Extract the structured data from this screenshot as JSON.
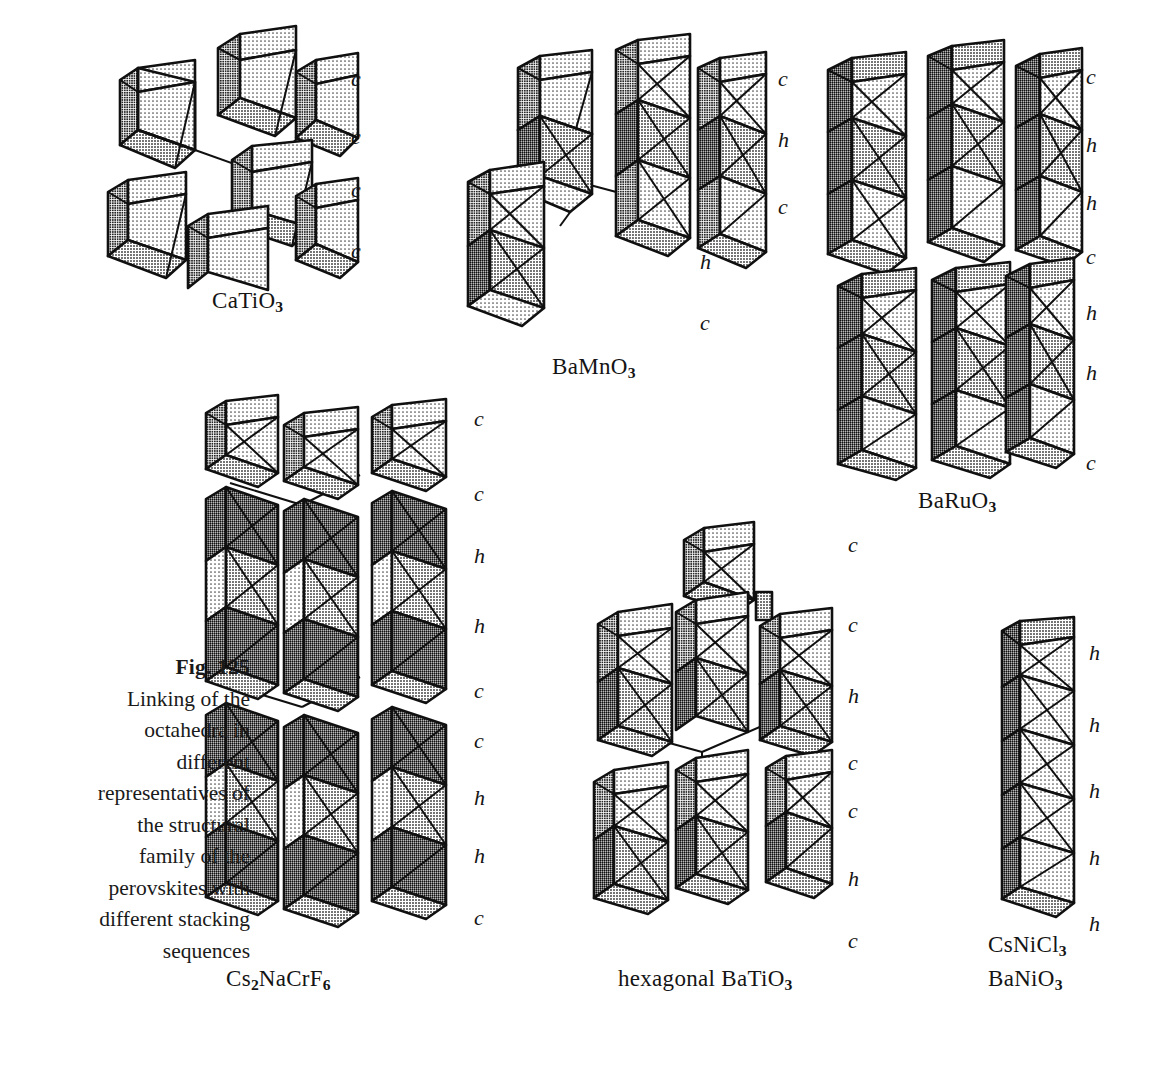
{
  "figure": {
    "number_label": "Fig. 125",
    "caption_lines": [
      "Linking of the",
      "octahedra in",
      "different",
      "representatives of",
      "the structural",
      "family of the",
      "perovskites with",
      "different stacking",
      "sequences"
    ],
    "caption_full": "Fig. 125 Linking of the octahedra in different representatives of the structural family of the perovskites with different stacking sequences"
  },
  "palette": {
    "ink": "#101010",
    "fill_light": "#f2f2f2",
    "fill_mid_light": "#dcdcdc",
    "fill_mid": "#b9b9b9",
    "fill_dark": "#8c8c8c",
    "fill_darker": "#6f6f6f",
    "background": "#ffffff"
  },
  "panels": [
    {
      "id": "catio3",
      "name": "CaTiO3",
      "formula_parts": [
        {
          "t": "CaTiO",
          "sub": false
        },
        {
          "t": "3",
          "sub": true
        }
      ],
      "formula_plain": "CaTiO3",
      "stacking_sequence": [
        "c",
        "c",
        "c",
        "c"
      ],
      "description": "corner-sharing octahedra, cubic perovskite"
    },
    {
      "id": "bamno3",
      "name": "BaMnO3",
      "formula_parts": [
        {
          "t": "BaMnO",
          "sub": false
        },
        {
          "t": "3",
          "sub": true
        }
      ],
      "formula_plain": "BaMnO3",
      "stacking_sequence": [
        "c",
        "h",
        "c",
        "h",
        "c"
      ],
      "description": "mixed corner and face sharing"
    },
    {
      "id": "baruo3",
      "name": "BaRuO3",
      "formula_parts": [
        {
          "t": "BaRuO",
          "sub": false
        },
        {
          "t": "3",
          "sub": true
        }
      ],
      "formula_plain": "BaRuO3",
      "stacking_sequence": [
        "c",
        "h",
        "h",
        "c",
        "h",
        "h",
        "c"
      ],
      "description": "nine-layer stacking"
    },
    {
      "id": "cs2nacrf6",
      "name": "Cs2NaCrF6",
      "formula_parts": [
        {
          "t": "Cs",
          "sub": false
        },
        {
          "t": "2",
          "sub": true
        },
        {
          "t": "NaCrF",
          "sub": false
        },
        {
          "t": "6",
          "sub": true
        }
      ],
      "formula_plain": "Cs2NaCrF6",
      "stacking_sequence": [
        "c",
        "c",
        "h",
        "h",
        "c",
        "c",
        "h",
        "h",
        "c"
      ],
      "description": "elpasolite-type stacking variant"
    },
    {
      "id": "hex-batio3",
      "name": "hexagonal BaTiO3",
      "formula_parts": [
        {
          "t": "hexagonal BaTiO",
          "sub": false
        },
        {
          "t": "3",
          "sub": true
        }
      ],
      "formula_plain": "hexagonal BaTiO3",
      "stacking_sequence": [
        "c",
        "c",
        "h",
        "c",
        "c",
        "h",
        "c"
      ],
      "description": "six-layer hexagonal perovskite"
    },
    {
      "id": "csnicl3",
      "name": "CsNiCl3 / BaNiO3",
      "formula_parts": [
        {
          "t": "CsNiCl",
          "sub": false
        },
        {
          "t": "3",
          "sub": true
        }
      ],
      "formula_parts_2": [
        {
          "t": "BaNiO",
          "sub": false
        },
        {
          "t": "3",
          "sub": true
        }
      ],
      "formula_plain": "CsNiCl3",
      "formula_plain_2": "BaNiO3",
      "stacking_sequence": [
        "h",
        "h",
        "h",
        "h",
        "h"
      ],
      "description": "purely face-sharing chain, 2H stacking"
    }
  ],
  "sequence_labels": {
    "catio3": [
      {
        "char": "c",
        "x": 351,
        "y": 68
      },
      {
        "char": "c",
        "x": 351,
        "y": 126
      },
      {
        "char": "c",
        "x": 351,
        "y": 179
      },
      {
        "char": "c",
        "x": 351,
        "y": 240
      }
    ],
    "bamno3": [
      {
        "char": "c",
        "x": 778,
        "y": 68
      },
      {
        "char": "h",
        "x": 778,
        "y": 129
      },
      {
        "char": "c",
        "x": 778,
        "y": 196
      },
      {
        "char": "h",
        "x": 700,
        "y": 251
      },
      {
        "char": "c",
        "x": 700,
        "y": 312
      }
    ],
    "baruo3": [
      {
        "char": "c",
        "x": 1086,
        "y": 66
      },
      {
        "char": "h",
        "x": 1086,
        "y": 134
      },
      {
        "char": "h",
        "x": 1086,
        "y": 192
      },
      {
        "char": "c",
        "x": 1086,
        "y": 246
      },
      {
        "char": "h",
        "x": 1086,
        "y": 302
      },
      {
        "char": "h",
        "x": 1086,
        "y": 362
      },
      {
        "char": "c",
        "x": 1086,
        "y": 452
      }
    ],
    "cs2nacrf6": [
      {
        "char": "c",
        "x": 474,
        "y": 408
      },
      {
        "char": "c",
        "x": 474,
        "y": 483
      },
      {
        "char": "h",
        "x": 474,
        "y": 545
      },
      {
        "char": "h",
        "x": 474,
        "y": 615
      },
      {
        "char": "c",
        "x": 474,
        "y": 680
      },
      {
        "char": "c",
        "x": 474,
        "y": 730
      },
      {
        "char": "h",
        "x": 474,
        "y": 787
      },
      {
        "char": "h",
        "x": 474,
        "y": 845
      },
      {
        "char": "c",
        "x": 474,
        "y": 907
      }
    ],
    "hex-batio3": [
      {
        "char": "c",
        "x": 848,
        "y": 534
      },
      {
        "char": "c",
        "x": 848,
        "y": 614
      },
      {
        "char": "h",
        "x": 848,
        "y": 685
      },
      {
        "char": "c",
        "x": 848,
        "y": 752
      },
      {
        "char": "c",
        "x": 848,
        "y": 800
      },
      {
        "char": "h",
        "x": 848,
        "y": 868
      },
      {
        "char": "c",
        "x": 848,
        "y": 930
      }
    ],
    "csnicl3": [
      {
        "char": "h",
        "x": 1089,
        "y": 642
      },
      {
        "char": "h",
        "x": 1089,
        "y": 714
      },
      {
        "char": "h",
        "x": 1089,
        "y": 780
      },
      {
        "char": "h",
        "x": 1089,
        "y": 847
      },
      {
        "char": "h",
        "x": 1089,
        "y": 913
      }
    ]
  },
  "formula_positions": {
    "catio3": {
      "x": 212,
      "y": 300
    },
    "bamno3": {
      "x": 552,
      "y": 366
    },
    "baruo3": {
      "x": 918,
      "y": 500
    },
    "cs2nacrf6": {
      "x": 226,
      "y": 978
    },
    "hex-batio3": {
      "x": 620,
      "y": 978
    },
    "csnicl3": {
      "x": 990,
      "y": 944
    },
    "banio3": {
      "x": 990,
      "y": 978
    }
  }
}
